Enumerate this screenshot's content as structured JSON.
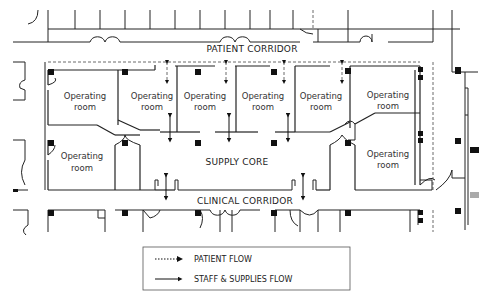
{
  "diagram": {
    "type": "floor-plan",
    "corridors": {
      "patient": "PATIENT CORRIDOR",
      "clinical": "CLINICAL CORRIDOR",
      "supply": "SUPPLY CORE"
    },
    "rooms": [
      {
        "line1": "Operating",
        "line2": "room"
      },
      {
        "line1": "Operating",
        "line2": "room"
      },
      {
        "line1": "Operating",
        "line2": "room"
      },
      {
        "line1": "Operating",
        "line2": "room"
      },
      {
        "line1": "Operating",
        "line2": "room"
      },
      {
        "line1": "Operating",
        "line2": "room"
      },
      {
        "line1": "Operating",
        "line2": "room"
      },
      {
        "line1": "Operating",
        "line2": "room"
      }
    ]
  },
  "legend": {
    "items": [
      {
        "label": "PATIENT FLOW",
        "style": "dotted"
      },
      {
        "label": "STAFF & SUPPLIES FLOW",
        "style": "solid-dotted"
      }
    ]
  },
  "colors": {
    "line": "#222222",
    "column": "#111111",
    "background": "#ffffff",
    "grey-column": "#999999"
  }
}
